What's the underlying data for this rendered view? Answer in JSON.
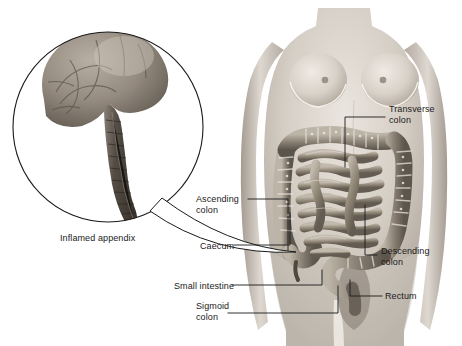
{
  "figure": {
    "type": "medical-illustration",
    "background_color": "#ffffff",
    "text_color": "#1a1a1a",
    "width": 462,
    "height": 346
  },
  "inset": {
    "caption": "Inflamed appendix",
    "shape": "circle",
    "center_x": 108,
    "center_y": 127,
    "radius": 95,
    "contents": [
      "caecum",
      "inflamed-appendix"
    ],
    "pointer_target": "caecum"
  },
  "labels": [
    {
      "id": "transverse-colon",
      "text": "Transverse\ncolon",
      "x": 389,
      "y": 104,
      "align": "left"
    },
    {
      "id": "ascending-colon",
      "text": "Ascending\ncolon",
      "x": 196,
      "y": 194,
      "align": "left"
    },
    {
      "id": "caecum",
      "text": "Caecum",
      "x": 200,
      "y": 241,
      "align": "left"
    },
    {
      "id": "descending-colon",
      "text": "Descending\ncolon",
      "x": 381,
      "y": 246,
      "align": "left"
    },
    {
      "id": "small-intestine",
      "text": "Small intestine",
      "x": 174,
      "y": 281,
      "align": "left"
    },
    {
      "id": "rectum",
      "text": "Rectum",
      "x": 385,
      "y": 291,
      "align": "left"
    },
    {
      "id": "sigmoid-colon",
      "text": "Sigmoid\ncolon",
      "x": 196,
      "y": 301,
      "align": "left"
    }
  ],
  "anatomy_parts": [
    "transverse colon",
    "ascending colon",
    "descending colon",
    "sigmoid colon",
    "caecum",
    "rectum",
    "small intestine",
    "appendix"
  ],
  "colors": {
    "skin_light": "#e2ddd6",
    "skin_mid": "#c9c2b9",
    "skin_shadow": "#a79f95",
    "colon_light": "#b5aca1",
    "colon_mid": "#8d8377",
    "colon_dark": "#5d564d",
    "appendix_dark": "#4a443c",
    "caecum_tissue": "#9a9086",
    "outline": "#1a1a1a"
  }
}
